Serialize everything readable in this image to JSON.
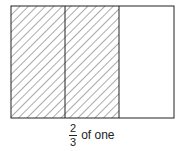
{
  "diagram": {
    "type": "fraction-area-model",
    "total_parts": 3,
    "shaded_parts": 2,
    "stroke_color": "#222222",
    "hatch_color": "#444444",
    "fill_color": "#ffffff"
  },
  "caption": {
    "numerator": "2",
    "denominator": "3",
    "text": "of one"
  }
}
